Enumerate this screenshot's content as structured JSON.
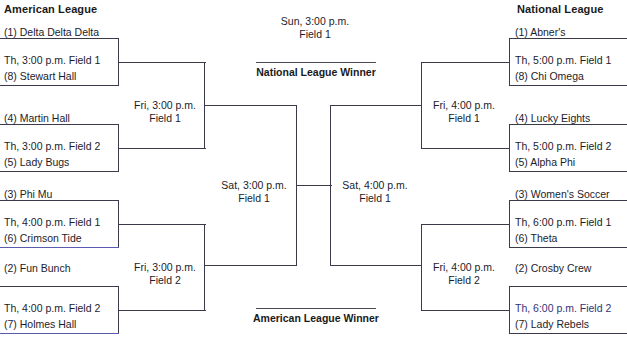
{
  "headers": {
    "left_league": "American League",
    "right_league": "National League"
  },
  "final": {
    "time": "Sun, 3:00 p.m.",
    "field": "Field 1"
  },
  "winner_labels": {
    "top": "National League Winner",
    "bottom": "American League Winner"
  },
  "semifinals": {
    "left": {
      "time": "Sat, 3:00 p.m.",
      "field": "Field 1"
    },
    "right": {
      "time": "Sat, 4:00 p.m.",
      "field": "Field 1"
    }
  },
  "quarterfinals": {
    "left_top": {
      "time": "Fri, 3:00 p.m.",
      "field": "Field 1"
    },
    "left_bottom": {
      "time": "Fri, 3:00 p.m.",
      "field": "Field 2"
    },
    "right_top": {
      "time": "Fri, 4:00 p.m.",
      "field": "Field 1"
    },
    "right_bottom": {
      "time": "Fri, 4:00 p.m.",
      "field": "Field 2"
    }
  },
  "first_round": {
    "left": [
      {
        "top_team": "(1) Delta Delta Delta",
        "match": "Th, 3:00 p.m. Field 1",
        "bottom_team": "(8) Stewart Hall"
      },
      {
        "top_team": "(4) Martin Hall",
        "match": "Th, 3:00 p.m. Field 2",
        "bottom_team": "(5) Lady Bugs"
      },
      {
        "top_team": "(3) Phi Mu",
        "match": "Th, 4:00 p.m. Field 1",
        "bottom_team": "(6) Crimson Tide"
      },
      {
        "top_team": "(2) Fun Bunch",
        "match": "Th, 4:00 p.m. Field 2",
        "bottom_team": "(7) Holmes Hall"
      }
    ],
    "right": [
      {
        "top_team": "(1) Abner's",
        "match": "Th, 5:00 p.m. Field 1",
        "bottom_team": "(8) Chi Omega"
      },
      {
        "top_team": "(4) Lucky Eights",
        "match": "Th, 5:00 p.m. Field 2",
        "bottom_team": "(5) Alpha Phi"
      },
      {
        "top_team": "(3) Women's Soccer",
        "match": "Th, 6:00 p.m. Field 1",
        "bottom_team": "(6) Theta"
      },
      {
        "top_team": "(2) Crosby Crew",
        "match": "Th, 6:00 p.m. Field 2",
        "bottom_team": "(7) Lady Rebels"
      }
    ]
  },
  "colors": {
    "line": "#3a3a4a",
    "text": "#1c1c2b",
    "accent": "#5a5ab0"
  }
}
